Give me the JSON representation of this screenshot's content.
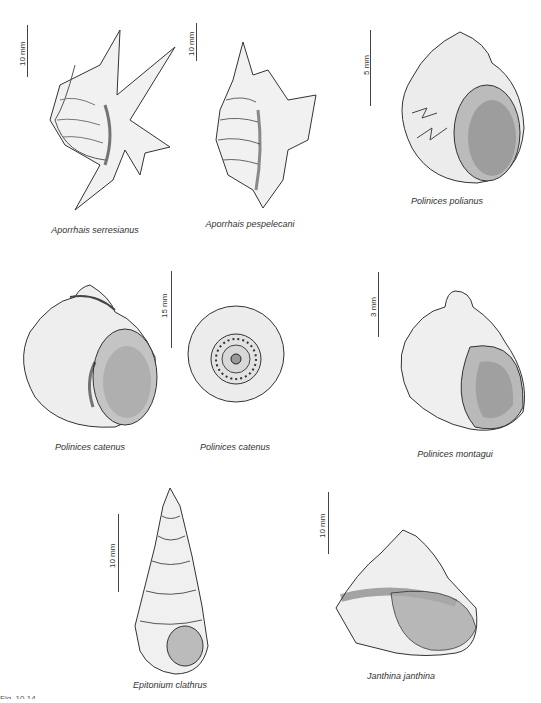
{
  "figure": {
    "label": "Fig. 10.14",
    "specimens": [
      {
        "name": "Aporrhais serresianus",
        "scale": "10 mm"
      },
      {
        "name": "Aporrhais pespelecani",
        "scale": "10 mm"
      },
      {
        "name": "Polinices polianus",
        "scale": "5 mm"
      },
      {
        "name": "Polinices catenus",
        "scale": "15 mm"
      },
      {
        "name": "Polinices catenus",
        "scale": ""
      },
      {
        "name": "Polinices montagui",
        "scale": "3 mm"
      },
      {
        "name": "Epitonium clathrus",
        "scale": "10 mm"
      },
      {
        "name": "Janthina janthina",
        "scale": "10 mm"
      }
    ]
  }
}
